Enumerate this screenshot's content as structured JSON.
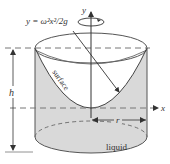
{
  "diagram": {
    "equation_label": "y = ω²x²/2g",
    "axis_y_label": "y",
    "axis_x_label": "x",
    "height_label": "h",
    "radius_label": "r",
    "surface_label": "surface",
    "liquid_label": "liquid",
    "rotation_icon": "rotation-arrow-icon",
    "colors": {
      "liquid_fill": "#d9d9d9",
      "stroke": "#444444",
      "dashed": "#666666",
      "background": "#ffffff"
    }
  }
}
